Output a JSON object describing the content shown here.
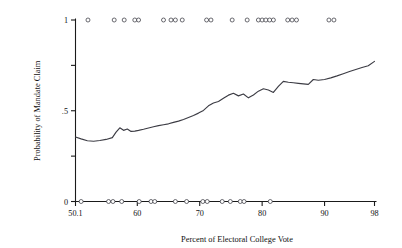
{
  "chart_data": {
    "type": "line",
    "title": "",
    "xlabel": "Percent of Electoral College Vote",
    "ylabel": "Probability of Mandate Claim",
    "xlim": [
      50.1,
      98
    ],
    "ylim": [
      0,
      1
    ],
    "grid": false,
    "legend_position": "none",
    "xticks": [
      50.1,
      60,
      70,
      80,
      90,
      98
    ],
    "xtick_labels": [
      "50.1",
      "60",
      "70",
      "80",
      "90",
      "98"
    ],
    "yticks": [
      0,
      0.25,
      0.5,
      0.75,
      1
    ],
    "ytick_labels": [
      "0",
      "",
      ".5",
      "",
      "1"
    ],
    "series": [
      {
        "name": "Probability of Mandate Claim",
        "type": "line",
        "x": [
          50.1,
          51.0,
          52.0,
          53.0,
          54.0,
          55.0,
          56.0,
          56.6,
          57.2,
          57.8,
          58.4,
          59.0,
          59.6,
          60.2,
          61.0,
          61.8,
          62.6,
          63.4,
          64.2,
          65.0,
          65.8,
          66.6,
          67.4,
          68.2,
          69.0,
          69.8,
          70.6,
          71.4,
          72.2,
          73.0,
          73.8,
          74.6,
          75.4,
          76.2,
          77.0,
          77.8,
          78.6,
          79.4,
          80.2,
          81.0,
          81.8,
          82.6,
          83.4,
          84.2,
          85.0,
          85.8,
          86.6,
          87.4,
          88.2,
          89.0,
          90.0,
          91.0,
          92.0,
          93.0,
          94.0,
          95.0,
          96.0,
          97.0,
          98.0
        ],
        "y": [
          0.355,
          0.345,
          0.335,
          0.332,
          0.336,
          0.342,
          0.352,
          0.382,
          0.406,
          0.392,
          0.399,
          0.386,
          0.388,
          0.392,
          0.398,
          0.405,
          0.412,
          0.418,
          0.423,
          0.428,
          0.436,
          0.443,
          0.452,
          0.463,
          0.474,
          0.487,
          0.502,
          0.527,
          0.543,
          0.551,
          0.569,
          0.586,
          0.596,
          0.582,
          0.592,
          0.571,
          0.587,
          0.608,
          0.621,
          0.614,
          0.601,
          0.634,
          0.662,
          0.657,
          0.654,
          0.651,
          0.648,
          0.645,
          0.672,
          0.668,
          0.672,
          0.681,
          0.692,
          0.704,
          0.716,
          0.727,
          0.738,
          0.748,
          0.772
        ]
      },
      {
        "name": "Observations at y = 1 (mandate claimed)",
        "type": "rug",
        "y_value": 1,
        "x": [
          52.1,
          56.3,
          57.9,
          59.6,
          60.2,
          64.2,
          65.4,
          66.1,
          67.2,
          71.1,
          71.8,
          75.2,
          77.6,
          79.4,
          80.0,
          80.6,
          81.2,
          81.8,
          84.1,
          84.8,
          85.5,
          90.7,
          91.5
        ]
      },
      {
        "name": "Observations at y = 0 (no mandate claim)",
        "type": "rug",
        "y_value": 0,
        "x": [
          51.0,
          55.4,
          56.1,
          57.5,
          60.3,
          62.2,
          62.8,
          66.1,
          67.9,
          70.5,
          71.2,
          73.6,
          74.9,
          76.5,
          77.1,
          81.3
        ]
      }
    ],
    "marker": {
      "shape": "open-circle",
      "radius_px": 2.0,
      "fill": "#ffffff",
      "stroke": "#3a3a42"
    },
    "colors": {
      "line": "#3c3c44",
      "axis": "#1a1a1a",
      "text": "#111111",
      "background": "#ffffff"
    }
  }
}
